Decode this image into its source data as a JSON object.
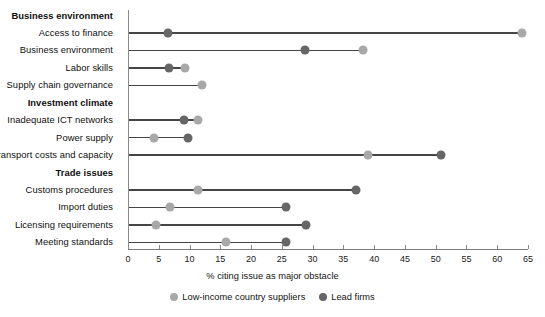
{
  "chart_data": {
    "type": "scatter",
    "subtype": "dumbbell",
    "title": "",
    "xlabel": "% citing issue as major obstacle",
    "ylabel": "",
    "xlim": [
      0,
      65
    ],
    "xticks": [
      0,
      5,
      10,
      15,
      20,
      25,
      30,
      35,
      40,
      45,
      50,
      55,
      60,
      65
    ],
    "grid": false,
    "legend_position": "bottom",
    "legend": [
      {
        "name": "Low-income country suppliers",
        "color": "#a8a8a8"
      },
      {
        "name": "Lead firms",
        "color": "#666666"
      }
    ],
    "groups": [
      {
        "group": "Business environment",
        "rows": [
          {
            "category": "Access to finance",
            "low_income_country_suppliers": 64.0,
            "lead_firms": 6.5
          },
          {
            "category": "Business environment",
            "low_income_country_suppliers": 38.2,
            "lead_firms": 28.8
          },
          {
            "category": "Labor skills",
            "low_income_country_suppliers": 9.3,
            "lead_firms": 6.7
          },
          {
            "category": "Supply chain governance",
            "low_income_country_suppliers": 12.0,
            "lead_firms": null
          }
        ]
      },
      {
        "group": "Investment climate",
        "rows": [
          {
            "category": "Inadequate ICT networks",
            "low_income_country_suppliers": 11.4,
            "lead_firms": 9.1
          },
          {
            "category": "Power supply",
            "low_income_country_suppliers": 4.2,
            "lead_firms": 9.8
          },
          {
            "category": "Transport costs and capacity",
            "low_income_country_suppliers": 39.0,
            "lead_firms": 50.9
          }
        ]
      },
      {
        "group": "Trade issues",
        "rows": [
          {
            "category": "Customs procedures",
            "low_income_country_suppliers": 11.3,
            "lead_firms": 37.0
          },
          {
            "category": "Import duties",
            "low_income_country_suppliers": 6.8,
            "lead_firms": 25.6
          },
          {
            "category": "Licensing requirements",
            "low_income_country_suppliers": 4.5,
            "lead_firms": 29.0
          },
          {
            "category": "Meeting standards",
            "low_income_country_suppliers": 16.0,
            "lead_firms": 25.6
          }
        ]
      }
    ]
  }
}
